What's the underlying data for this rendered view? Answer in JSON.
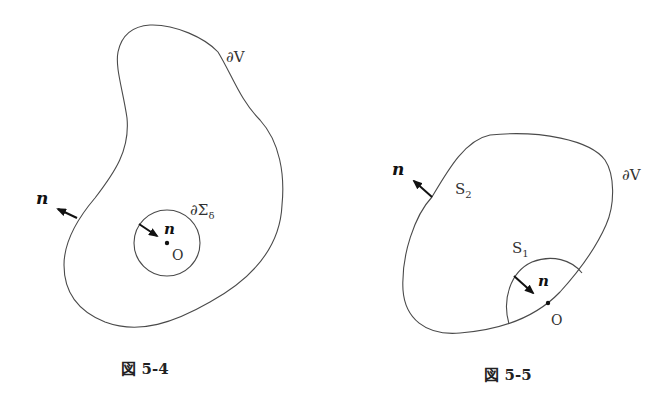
{
  "figures": [
    {
      "id": "fig-5-4",
      "caption": "図 5-4",
      "labels": {
        "boundary": "∂V",
        "outer_normal": "n",
        "inner_normal": "n",
        "inner_boundary": "∂Σ",
        "inner_boundary_sub": "δ",
        "origin": "O"
      }
    },
    {
      "id": "fig-5-5",
      "caption": "図 5-5",
      "labels": {
        "boundary": "∂V",
        "outer_normal": "n",
        "s2": "S",
        "s2_sub": "2",
        "s1": "S",
        "s1_sub": "1",
        "inner_normal": "n",
        "origin": "O"
      }
    }
  ]
}
